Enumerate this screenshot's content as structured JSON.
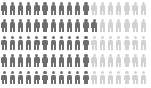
{
  "chart_data": {
    "type": "pictogram",
    "title": "",
    "subtitle": "",
    "xlabel": "",
    "ylabel": "",
    "icon": "person-icon",
    "rows": 5,
    "columns": 18,
    "total_icons": 90,
    "filled_icons": 56,
    "unfilled_icons": 34,
    "filled_fraction": 0.62,
    "filled_percent": "62%",
    "icon_unit_value": 1,
    "legend": [],
    "annotations": [],
    "grid": false,
    "colors": {
      "filled": "#6e6e6e",
      "unfilled": "#d2d2d2",
      "background": "#ffffff"
    },
    "series": [
      {
        "name": "filled",
        "color": "#6e6e6e",
        "values": [
          11,
          12,
          11,
          11,
          11
        ]
      },
      {
        "name": "unfilled",
        "color": "#d2d2d2",
        "values": [
          7,
          6,
          7,
          7,
          7
        ]
      }
    ],
    "matrix": [
      [
        "filled",
        "filled",
        "filled",
        "filled",
        "filled",
        "filled",
        "filled",
        "filled",
        "filled",
        "filled",
        "filled",
        "unfilled",
        "unfilled",
        "unfilled",
        "unfilled",
        "unfilled",
        "unfilled",
        "unfilled"
      ],
      [
        "filled",
        "filled",
        "filled",
        "filled",
        "filled",
        "filled",
        "filled",
        "filled",
        "filled",
        "filled",
        "filled",
        "filled",
        "unfilled",
        "unfilled",
        "unfilled",
        "unfilled",
        "unfilled",
        "unfilled"
      ],
      [
        "filled",
        "filled",
        "filled",
        "filled",
        "filled",
        "filled",
        "filled",
        "filled",
        "filled",
        "filled",
        "filled",
        "unfilled",
        "unfilled",
        "unfilled",
        "unfilled",
        "unfilled",
        "unfilled",
        "unfilled"
      ],
      [
        "filled",
        "filled",
        "filled",
        "filled",
        "filled",
        "filled",
        "filled",
        "filled",
        "filled",
        "filled",
        "filled",
        "unfilled",
        "unfilled",
        "unfilled",
        "unfilled",
        "unfilled",
        "unfilled",
        "unfilled"
      ],
      [
        "filled",
        "filled",
        "filled",
        "filled",
        "filled",
        "filled",
        "filled",
        "filled",
        "filled",
        "filled",
        "filled",
        "unfilled",
        "unfilled",
        "unfilled",
        "unfilled",
        "unfilled",
        "unfilled",
        "unfilled"
      ]
    ]
  }
}
